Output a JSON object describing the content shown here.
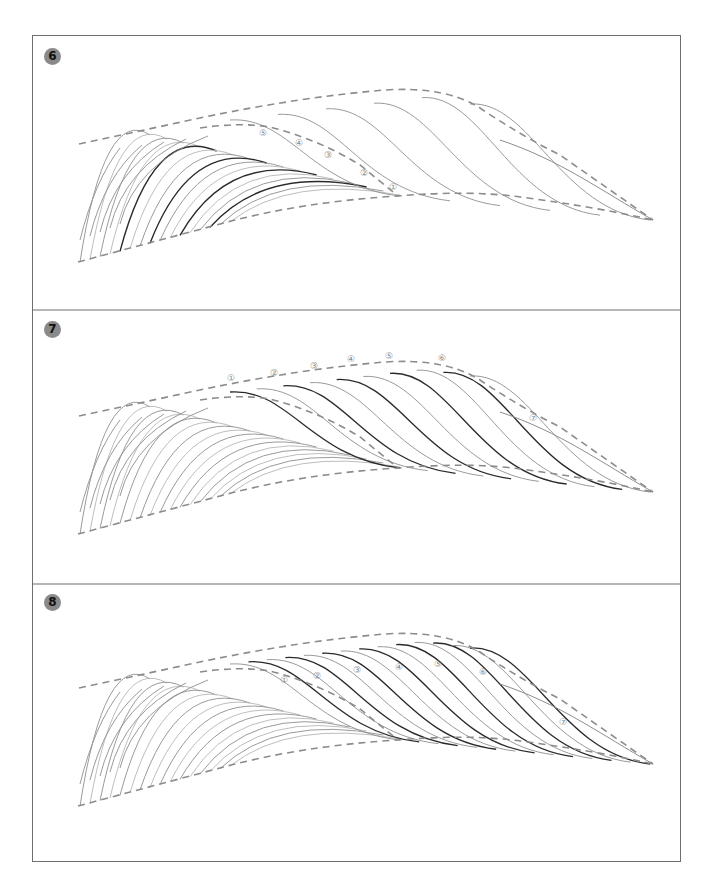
{
  "figure": {
    "width": 713,
    "height": 891,
    "frame": {
      "left": 32,
      "top": 35,
      "right": 681,
      "bottom": 862
    },
    "colors": {
      "border": "#6e6e6e",
      "badge_fill": "#8a8a8a",
      "badge_text": "#111111",
      "guide_dash": "#8c8c8c",
      "stroke_light": "#b5b5b5",
      "stroke_mid": "#8e8e8e",
      "stroke_dark": "#2a2a2a",
      "label": "#8a8a8a"
    }
  },
  "panels": [
    {
      "id": "panel-6",
      "badge": "6",
      "top": 35,
      "bottom": 310,
      "badge_pos": [
        52,
        56
      ],
      "offset_y": 0,
      "labels": [
        {
          "text": "①",
          "x": 393,
          "y": 187
        },
        {
          "text": "②",
          "x": 364,
          "y": 173
        },
        {
          "text": "③",
          "x": 328,
          "y": 155
        },
        {
          "text": "④",
          "x": 299,
          "y": 143
        },
        {
          "text": "⑤",
          "x": 263,
          "y": 133
        }
      ],
      "highlight": "fan"
    },
    {
      "id": "panel-7",
      "badge": "7",
      "top": 310,
      "bottom": 584,
      "badge_pos": [
        52,
        329
      ],
      "offset_y": 272,
      "labels": [
        {
          "text": "①",
          "x": 231,
          "y": 378
        },
        {
          "text": "②",
          "x": 274,
          "y": 373
        },
        {
          "text": "③",
          "x": 314,
          "y": 366
        },
        {
          "text": "④",
          "x": 351,
          "y": 359
        },
        {
          "text": "⑤",
          "x": 389,
          "y": 356
        },
        {
          "text": "⑥",
          "x": 442,
          "y": 358
        },
        {
          "text": "⑦",
          "x": 533,
          "y": 418
        }
      ],
      "highlight": "waves-top"
    },
    {
      "id": "panel-8",
      "badge": "8",
      "top": 584,
      "bottom": 862,
      "badge_pos": [
        52,
        602
      ],
      "offset_y": 544,
      "labels": [
        {
          "text": "①",
          "x": 284,
          "y": 680
        },
        {
          "text": "②",
          "x": 317,
          "y": 676
        },
        {
          "text": "③",
          "x": 357,
          "y": 670
        },
        {
          "text": "④",
          "x": 399,
          "y": 667
        },
        {
          "text": "⑤",
          "x": 438,
          "y": 664
        },
        {
          "text": "⑥",
          "x": 483,
          "y": 672
        },
        {
          "text": "⑦",
          "x": 563,
          "y": 722
        }
      ],
      "highlight": "waves-mid"
    }
  ],
  "guides": {
    "upper": "M79,144 L200,118 Q300,97 385,90 Q445,86 480,108 Q520,135 560,155 L653,220",
    "fan_top": "M200,128 Q240,122 270,127 Q320,140 360,165 L398,196",
    "lower": "M78,262 L220,224 Q300,202 398,196 Q470,190 520,197 Q590,206 653,220"
  }
}
